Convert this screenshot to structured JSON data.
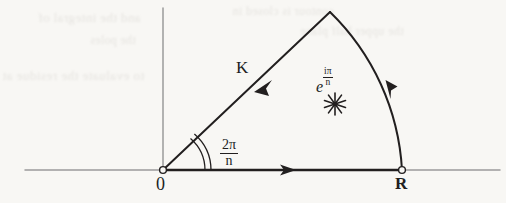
{
  "figure": {
    "background_color": "#f8f7f4",
    "ink_color": "#221f1f",
    "axis_color": "#9b9b9b",
    "width": 506,
    "height": 203
  },
  "axes": {
    "horizontal": {
      "name": "real-axis",
      "x_start": 25,
      "x_end": 500,
      "y": 170
    },
    "vertical": {
      "name": "imaginary-axis",
      "x": 163,
      "y_start": 8,
      "y_end": 170
    },
    "origin": {
      "x": 163,
      "y": 170
    }
  },
  "contour": {
    "name": "wedge-contour",
    "apex": {
      "x": 330,
      "y": 12
    },
    "radius_point": {
      "x": 402,
      "y": 170
    },
    "segments": [
      {
        "name": "ray-K",
        "from": "apex",
        "to": "origin",
        "arrow_direction": "down-left",
        "arrow_at": {
          "x": 258,
          "y": 88
        }
      },
      {
        "name": "real-segment",
        "from": "origin",
        "to": "R",
        "arrow_direction": "right",
        "arrow_at": {
          "x": 290,
          "y": 170
        }
      },
      {
        "name": "circular-arc",
        "from": "R",
        "to": "apex",
        "arrow_direction": "up-left",
        "arrow_at": {
          "x": 388,
          "y": 85
        }
      }
    ]
  },
  "labels": {
    "ray_label": "K",
    "origin_label": "0",
    "radius_label": "R",
    "pole_base": "e",
    "pole_exponent_numerator": "iπ",
    "pole_exponent_denominator": "n",
    "angle_numerator": "2π",
    "angle_denominator": "n"
  },
  "markers": {
    "origin_point": {
      "name": "origin-dot",
      "style": "open-circle",
      "x": 163,
      "y": 170,
      "r": 3.4
    },
    "radius_point": {
      "name": "radius-dot",
      "style": "open-circle",
      "x": 402,
      "y": 170,
      "r": 3.4
    },
    "pole_star": {
      "name": "pole-starburst",
      "style": "asterisk-starburst",
      "x": 335,
      "y": 104,
      "rays": 10,
      "radius": 11
    },
    "angle_arc": {
      "name": "angle-arc-marker",
      "style": "double-arc",
      "cx": 163,
      "cy": 170,
      "r_inner": 42,
      "r_outer": 48
    }
  },
  "bleed_through": {
    "note": "faint mirrored text showing through from the reverse side of the scanned page",
    "lines": [
      "and the integral of",
      "the poles",
      "to evaluate the residue at",
      "contour is closed in",
      "the upper half plane"
    ]
  }
}
